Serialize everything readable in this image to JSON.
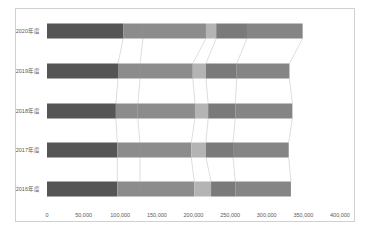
{
  "chart_data": {
    "type": "bar",
    "orientation": "horizontal",
    "stacked": true,
    "title": "",
    "xlabel": "",
    "ylabel": "",
    "xlim": [
      0,
      400000
    ],
    "x_ticks": [
      "0",
      "50,000",
      "100,000",
      "150,000",
      "200,000",
      "250,000",
      "300,000",
      "350,000",
      "400,000"
    ],
    "grid": false,
    "legend": "none",
    "series_lines": true,
    "categories": [
      "2020年度",
      "2019年度",
      "2018年度",
      "2017年度",
      "2016年度"
    ],
    "series": [
      {
        "name": "Segment 1",
        "color": "#555555",
        "values": [
          104000,
          97000,
          94000,
          96000,
          96000
        ]
      },
      {
        "name": "Segment 2",
        "color": "#8c8c8c",
        "values": [
          27000,
          30000,
          30000,
          31000,
          31000
        ]
      },
      {
        "name": "Segment 3",
        "color": "#8c8c8c",
        "values": [
          86000,
          72000,
          78000,
          70000,
          74000
        ]
      },
      {
        "name": "Segment 4",
        "color": "#b4b4b4",
        "values": [
          14000,
          18000,
          18000,
          20000,
          23000
        ]
      },
      {
        "name": "Segment 5",
        "color": "#7a7a7a",
        "values": [
          42000,
          42000,
          37000,
          37000,
          33000
        ]
      },
      {
        "name": "Segment 6",
        "color": "#858585",
        "values": [
          76000,
          72000,
          78000,
          76000,
          76000
        ]
      }
    ]
  }
}
